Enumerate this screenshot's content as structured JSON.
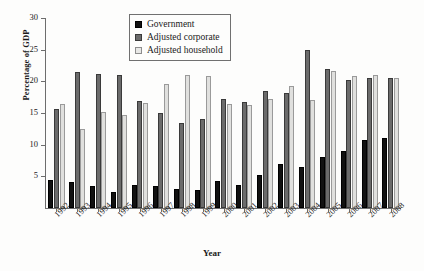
{
  "chart_data": {
    "type": "bar",
    "title": "",
    "xlabel": "Year",
    "ylabel": "Percentage of GDP",
    "ylim": [
      0,
      30
    ],
    "yticks": [
      0,
      5,
      10,
      15,
      20,
      25,
      30
    ],
    "ytick_labels": [
      "",
      "5",
      "10",
      "15",
      "20",
      "25",
      "30"
    ],
    "grid": false,
    "legend_position": "top-center",
    "categories": [
      "1992",
      "1993",
      "1994",
      "1995",
      "1996",
      "1997",
      "1998",
      "1999",
      "2000",
      "2001",
      "2002",
      "2003",
      "2004",
      "2005",
      "2006",
      "2007",
      "2008"
    ],
    "series": [
      {
        "name": "Government",
        "color": "#111111",
        "values": [
          4.5,
          4.1,
          3.4,
          2.6,
          3.6,
          3.4,
          3.0,
          2.9,
          4.3,
          3.7,
          5.2,
          7.0,
          6.4,
          8.1,
          9.0,
          10.8,
          11.1
        ]
      },
      {
        "name": "Adjusted corporate",
        "color": "#6b6b6b",
        "values": [
          15.6,
          21.5,
          21.1,
          21.0,
          16.9,
          15.0,
          13.4,
          14.0,
          17.2,
          16.8,
          18.5,
          18.1,
          25.0,
          22.0,
          20.2,
          20.5,
          20.6
        ]
      },
      {
        "name": "Adjusted household",
        "color": "#e0e0de",
        "values": [
          16.4,
          12.5,
          15.1,
          14.7,
          16.6,
          19.6,
          21.0,
          20.9,
          16.5,
          16.2,
          17.2,
          19.2,
          17.1,
          21.6,
          20.9,
          21.0,
          20.6
        ]
      }
    ]
  },
  "legend": {
    "items": [
      {
        "label": "Government"
      },
      {
        "label": "Adjusted corporate"
      },
      {
        "label": "Adjusted household"
      }
    ]
  }
}
